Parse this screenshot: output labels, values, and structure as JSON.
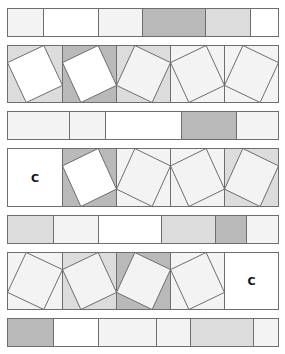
{
  "diagram": {
    "colors": {
      "white": "#ffffff",
      "light": "#f3f3f3",
      "medium": "#dcdcdc",
      "dark": "#b9b9b9",
      "stroke": "#6e6e6e"
    },
    "left": 7,
    "right": 278,
    "rows": [
      {
        "type": "strip",
        "y": 8,
        "h": 28,
        "cuts": [
          7,
          43,
          98,
          142,
          205,
          250,
          278
        ],
        "fills": [
          "light",
          "white",
          "light",
          "dark",
          "medium",
          "white"
        ]
      },
      {
        "type": "blocks",
        "y": 45,
        "h": 57,
        "blocks": [
          {
            "x": 7,
            "w": 55,
            "tilt": "A",
            "fill": "medium",
            "square": "white"
          },
          {
            "x": 62,
            "w": 54,
            "tilt": "A",
            "fill": "dark",
            "square": "white"
          },
          {
            "x": 116,
            "w": 54,
            "tilt": "B",
            "fill": "medium",
            "square": "light"
          },
          {
            "x": 170,
            "w": 54,
            "tilt": "A",
            "fill": "light",
            "square": "light"
          },
          {
            "x": 224,
            "w": 54,
            "tilt": "B",
            "fill": "light",
            "square": "light"
          }
        ]
      },
      {
        "type": "strip",
        "y": 111,
        "h": 28,
        "cuts": [
          7,
          69,
          105,
          181,
          236,
          278
        ],
        "fills": [
          "light",
          "light",
          "white",
          "dark",
          "light"
        ]
      },
      {
        "type": "blocks",
        "y": 148,
        "h": 58,
        "blocks": [
          {
            "x": 7,
            "w": 55,
            "tilt": "none",
            "fill": "white",
            "label": "C"
          },
          {
            "x": 62,
            "w": 54,
            "tilt": "A",
            "fill": "dark",
            "square": "white"
          },
          {
            "x": 116,
            "w": 54,
            "tilt": "B",
            "fill": "light",
            "square": "light"
          },
          {
            "x": 170,
            "w": 54,
            "tilt": "A",
            "fill": "light",
            "square": "light"
          },
          {
            "x": 224,
            "w": 54,
            "tilt": "B",
            "fill": "medium",
            "square": "light"
          }
        ]
      },
      {
        "type": "strip",
        "y": 215,
        "h": 28,
        "cuts": [
          7,
          53,
          98,
          161,
          215,
          246,
          278
        ],
        "fills": [
          "medium",
          "light",
          "white",
          "medium",
          "dark",
          "light"
        ]
      },
      {
        "type": "blocks",
        "y": 252,
        "h": 57,
        "blocks": [
          {
            "x": 7,
            "w": 55,
            "tilt": "B",
            "fill": "light",
            "square": "light"
          },
          {
            "x": 62,
            "w": 54,
            "tilt": "A",
            "fill": "medium",
            "square": "light"
          },
          {
            "x": 116,
            "w": 54,
            "tilt": "B",
            "fill": "dark",
            "square": "light"
          },
          {
            "x": 170,
            "w": 54,
            "tilt": "A",
            "fill": "light",
            "square": "light"
          },
          {
            "x": 224,
            "w": 54,
            "tilt": "none",
            "fill": "white",
            "label": "C"
          }
        ]
      },
      {
        "type": "strip",
        "y": 318,
        "h": 28,
        "cuts": [
          7,
          53,
          98,
          156,
          190,
          253,
          278
        ],
        "fills": [
          "dark",
          "white",
          "light",
          "light",
          "medium",
          "light"
        ]
      }
    ]
  }
}
